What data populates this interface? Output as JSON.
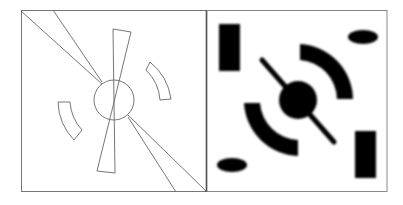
{
  "figure": {
    "panels": [
      {
        "name": "outline-panel",
        "style": "line drawing"
      },
      {
        "name": "filled-panel",
        "style": "blurred filled shapes"
      }
    ],
    "colors": {
      "stroke": "#555555",
      "fill": "#000000",
      "frame": "#888888",
      "divider": "#222222"
    }
  }
}
